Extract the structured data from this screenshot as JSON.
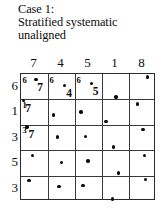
{
  "caption": {
    "lines": [
      "Case 1:",
      "Stratified systematic",
      "unaligned"
    ]
  },
  "chart_data": {
    "type": "scatter",
    "title": "Case 1: Stratified systematic unaligned",
    "xlabel": "",
    "ylabel": "",
    "grid": true,
    "legend": null,
    "columns": 5,
    "rows": 5,
    "xlim": [
      0,
      5
    ],
    "ylim": [
      0,
      5
    ],
    "column_headers": [
      "7",
      "4",
      "5",
      "1",
      "8"
    ],
    "row_labels": [
      "6",
      "1",
      "3",
      "5",
      "3"
    ],
    "points": [
      {
        "cell_row": 0,
        "cell_col": 0,
        "x": 0.55,
        "y": 4.78
      },
      {
        "cell_row": 0,
        "cell_col": 1,
        "x": 1.62,
        "y": 4.55
      },
      {
        "cell_row": 0,
        "cell_col": 2,
        "x": 2.6,
        "y": 4.62
      },
      {
        "cell_row": 0,
        "cell_col": 3,
        "x": 3.52,
        "y": 4.1
      },
      {
        "cell_row": 0,
        "cell_col": 4,
        "x": 4.68,
        "y": 4.88
      },
      {
        "cell_row": 1,
        "cell_col": 0,
        "x": 0.1,
        "y": 3.95
      },
      {
        "cell_row": 1,
        "cell_col": 1,
        "x": 1.2,
        "y": 3.38
      },
      {
        "cell_row": 1,
        "cell_col": 2,
        "x": 2.22,
        "y": 3.5
      },
      {
        "cell_row": 1,
        "cell_col": 3,
        "x": 3.15,
        "y": 3.12
      },
      {
        "cell_row": 1,
        "cell_col": 4,
        "x": 4.32,
        "y": 3.82
      },
      {
        "cell_row": 2,
        "cell_col": 0,
        "x": 0.22,
        "y": 2.92
      },
      {
        "cell_row": 2,
        "cell_col": 1,
        "x": 1.35,
        "y": 2.52
      },
      {
        "cell_row": 2,
        "cell_col": 2,
        "x": 2.38,
        "y": 2.55
      },
      {
        "cell_row": 2,
        "cell_col": 3,
        "x": 3.42,
        "y": 2.12
      },
      {
        "cell_row": 2,
        "cell_col": 4,
        "x": 4.52,
        "y": 2.82
      },
      {
        "cell_row": 3,
        "cell_col": 0,
        "x": 0.42,
        "y": 1.78
      },
      {
        "cell_row": 3,
        "cell_col": 1,
        "x": 1.5,
        "y": 1.52
      },
      {
        "cell_row": 3,
        "cell_col": 2,
        "x": 2.48,
        "y": 1.58
      },
      {
        "cell_row": 3,
        "cell_col": 3,
        "x": 3.6,
        "y": 1.1
      },
      {
        "cell_row": 3,
        "cell_col": 4,
        "x": 4.58,
        "y": 1.8
      },
      {
        "cell_row": 4,
        "cell_col": 0,
        "x": 0.3,
        "y": 0.8
      },
      {
        "cell_row": 4,
        "cell_col": 1,
        "x": 1.4,
        "y": 0.58
      },
      {
        "cell_row": 4,
        "cell_col": 2,
        "x": 2.3,
        "y": 0.62
      },
      {
        "cell_row": 4,
        "cell_col": 3,
        "x": 3.38,
        "y": 0.08
      },
      {
        "cell_row": 4,
        "cell_col": 4,
        "x": 4.62,
        "y": 0.85
      }
    ],
    "annotations": [
      {
        "text": "6",
        "cell_row": 0,
        "cell_col": 0,
        "role": "row-offset"
      },
      {
        "text": "7",
        "cell_row": 0,
        "cell_col": 0,
        "role": "col-offset"
      },
      {
        "text": "6",
        "cell_row": 0,
        "cell_col": 1,
        "role": "row-offset"
      },
      {
        "text": "4",
        "cell_row": 0,
        "cell_col": 1,
        "role": "col-offset"
      },
      {
        "text": "6",
        "cell_row": 0,
        "cell_col": 2,
        "role": "row-offset"
      },
      {
        "text": "5",
        "cell_row": 0,
        "cell_col": 2,
        "role": "col-offset"
      },
      {
        "text": "1",
        "cell_row": 1,
        "cell_col": 0,
        "role": "row-offset"
      },
      {
        "text": "7",
        "cell_row": 1,
        "cell_col": 0,
        "role": "col-offset"
      },
      {
        "text": "3",
        "cell_row": 2,
        "cell_col": 0,
        "role": "row-offset"
      },
      {
        "text": "7",
        "cell_row": 2,
        "cell_col": 0,
        "role": "col-offset"
      }
    ]
  },
  "colors": {
    "ink": "#0a0a0a",
    "grid_line": "#3a3a3a",
    "border": "#2b2b2b",
    "background": "#ffffff"
  }
}
